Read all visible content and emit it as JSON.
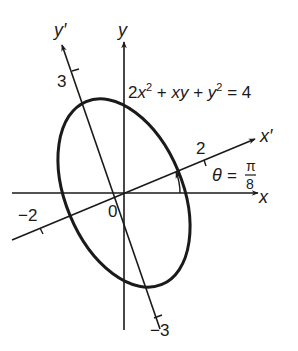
{
  "diagram": {
    "equation": {
      "text": "2x² + xy + y² = 4",
      "parts": [
        "2",
        "x",
        "2",
        " + ",
        "xy",
        " + ",
        "y",
        "2",
        " = 4"
      ]
    },
    "axes": {
      "x_label": "x",
      "y_label": "y",
      "x_prime_label": "x",
      "y_prime_label": "y",
      "prime_mark": "′",
      "origin_label": "0"
    },
    "ticks": {
      "x_prime_pos": "2",
      "x_prime_neg": "−2",
      "y_prime_pos": "3",
      "y_prime_neg": "−3"
    },
    "angle": {
      "symbol": "θ",
      "equals": "=",
      "numerator": "π",
      "denominator": "8"
    },
    "colors": {
      "ink": "#1a1a1a",
      "background": "#ffffff"
    }
  }
}
